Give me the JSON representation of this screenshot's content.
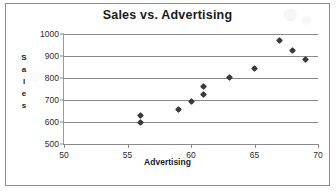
{
  "chart_data": {
    "type": "scatter",
    "title": "Sales vs. Advertising",
    "xlabel": "Advertising",
    "ylabel": "Sales",
    "xlim": [
      50,
      70
    ],
    "ylim": [
      500,
      1000
    ],
    "xticks": [
      50,
      55,
      60,
      65,
      70
    ],
    "yticks": [
      500,
      600,
      700,
      800,
      900,
      1000
    ],
    "grid": "horizontal",
    "legend": "none",
    "marker": "diamond",
    "marker_color": "#3a3a3a",
    "series": [
      {
        "name": "Sales",
        "points": [
          {
            "x": 56,
            "y": 630
          },
          {
            "x": 56,
            "y": 600
          },
          {
            "x": 59,
            "y": 658
          },
          {
            "x": 60,
            "y": 693
          },
          {
            "x": 61,
            "y": 760
          },
          {
            "x": 61,
            "y": 725
          },
          {
            "x": 63,
            "y": 803
          },
          {
            "x": 65,
            "y": 842
          },
          {
            "x": 67,
            "y": 972
          },
          {
            "x": 68,
            "y": 927
          },
          {
            "x": 69,
            "y": 885
          }
        ]
      }
    ]
  },
  "ylabel_letters": [
    "S",
    "a",
    "l",
    "e",
    "s"
  ]
}
